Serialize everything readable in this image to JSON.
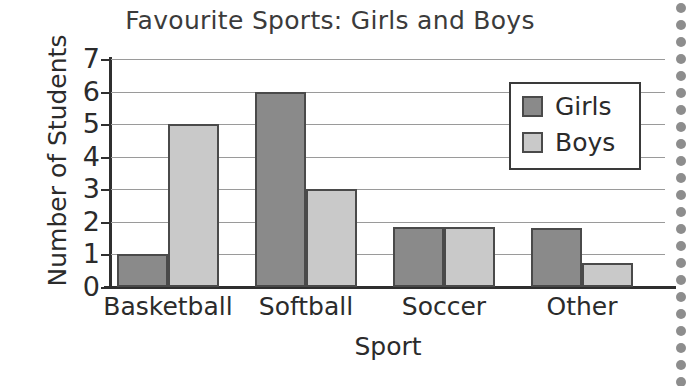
{
  "chart_data": {
    "type": "bar",
    "title": "Favourite Sports: Girls and Boys",
    "xlabel": "Sport",
    "ylabel": "Number of Students",
    "categories": [
      "Basketball",
      "Softball",
      "Soccer",
      "Other"
    ],
    "series": [
      {
        "name": "Girls",
        "color": "#8a8a8a",
        "values": [
          1,
          6,
          1.85,
          1.8
        ]
      },
      {
        "name": "Boys",
        "color": "#c9c9c9",
        "values": [
          5,
          3,
          1.85,
          0.75
        ]
      }
    ],
    "ylim": [
      0,
      7
    ],
    "yticks": [
      0,
      1,
      2,
      3,
      4,
      5,
      6,
      7
    ],
    "ytick_labels": [
      "0",
      "1",
      "2",
      "3",
      "4",
      "5",
      "6",
      "7"
    ],
    "grid": true,
    "grid_axis": "y",
    "legend": {
      "position": "top-right",
      "entries": [
        "Girls",
        "Boys"
      ]
    },
    "bar_border_color": "#4a4a4a",
    "axis_color": "#2f2f2f",
    "gridline_color": "#9a9a9a",
    "text_color": "#2b2b2b",
    "background": "#ffffff"
  },
  "page": {
    "binding_dot_color": "#8d8d8d",
    "binding_dot_count": 23
  }
}
